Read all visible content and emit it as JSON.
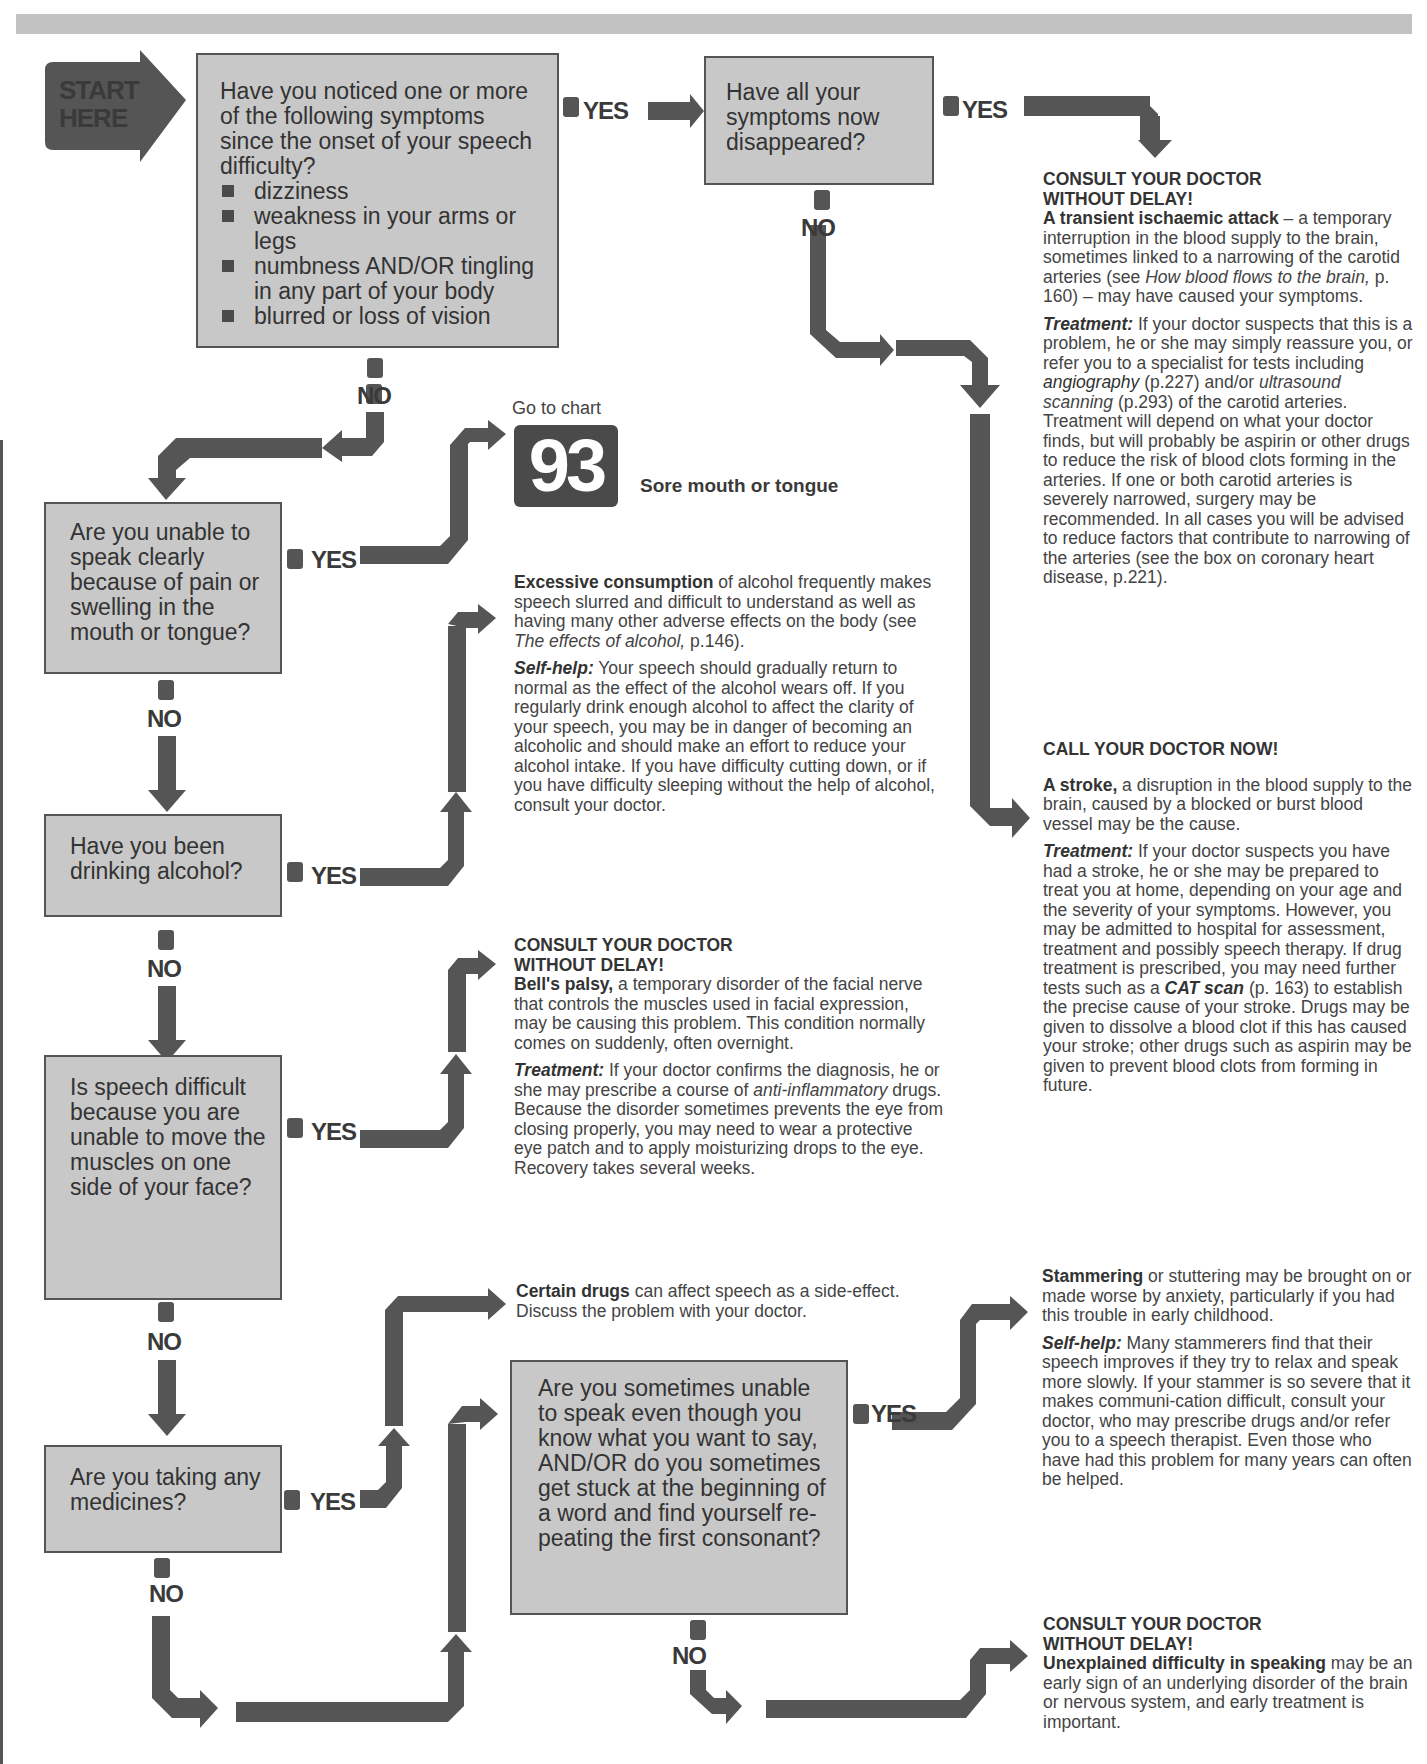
{
  "page": {
    "accent_color": "#555555",
    "box_fill": "#c8c8c8",
    "band_color": "#c2c2c2"
  },
  "start": {
    "line1": "START",
    "line2": "HERE"
  },
  "labels": {
    "yes": "YES",
    "no": "NO"
  },
  "questions": [
    {
      "id": "q1",
      "text": "Have you noticed one or more of the following symptoms since the onset of your speech difficulty?",
      "bullets": [
        "dizziness",
        "weakness in your arms or legs",
        "numbness AND/OR tingling in any part of your body",
        "blurred or loss of vision"
      ]
    },
    {
      "id": "q2",
      "text": "Have all your symptoms now disappeared?"
    },
    {
      "id": "q3",
      "text": "Are you unable to speak clearly because of pain or swelling in the mouth or tongue?"
    },
    {
      "id": "q4",
      "text": "Have you been drinking alcohol?"
    },
    {
      "id": "q5",
      "text": "Is speech difficult because you are unable to move the muscles on one side of your face?"
    },
    {
      "id": "q6",
      "text": "Are you taking any medicines?"
    },
    {
      "id": "q7",
      "text": "Are you sometimes unable to speak even though you know what you want to say, AND/OR do you sometimes get stuck at the beginning of a word and find yourself re-peating the first consonant?"
    }
  ],
  "goto_chart": {
    "label": "Go to chart",
    "number": "93",
    "title": "Sore mouth or tongue"
  },
  "outcomes": {
    "tia": {
      "heading1": "CONSULT YOUR DOCTOR",
      "heading2": "WITHOUT DELAY!",
      "term": "A transient ischaemic attack",
      "text1": " – a temporary interruption in the blood supply to the brain, sometimes linked to a narrowing of the carotid arteries (see ",
      "ref": "How blood flows to the brain,",
      "text2": " p. 160) – may have caused your symptoms.",
      "treatment_label": "Treatment:",
      "t1": " If your doctor suspects that this is a problem, he or she may simply reassure you, or refer you to a specialist for tests including ",
      "t_angio": "angiography",
      "t2": " (p.227) and/or ",
      "t_ultra": "ultrasound scanning",
      "t3": " (p.293) of the carotid arteries. Treatment will depend on what your doctor finds, but will probably be aspirin or other drugs to reduce the risk of blood clots forming in the arteries. If one or both carotid arteries is severely narrowed, surgery may be recommended. In all cases you will be advised to reduce factors that contribute to narrowing of the arteries (see the box on coronary heart disease, p.221)."
    },
    "stroke": {
      "heading": "CALL YOUR DOCTOR NOW!",
      "term": "A stroke,",
      "text": " a disruption in the blood supply to the brain, caused by a blocked or burst blood vessel may be the cause.",
      "treatment_label": "Treatment:",
      "t1": "  If your doctor suspects you have had a stroke, he or she may be prepared to treat you at home, depending on your age and the severity of your symptoms.  However, you may be admitted to hospital for assessment, treatment and possibly speech therapy. If drug treatment is prescribed,  you may need further tests such as a ",
      "t_cat": "CAT scan",
      "t2": " (p. 163) to establish the precise cause of your stroke.  Drugs may be given to dissolve a blood clot if this has caused your stroke; other drugs such as aspirin may be given to prevent blood clots from forming in future."
    },
    "alcohol": {
      "term": "Excessive consumption",
      "text1": " of alcohol frequently makes speech slurred and difficult to understand as well as having many other adverse effects on the body (see ",
      "ref": "The effects of alcohol,",
      "text2": " p.146).",
      "selfhelp_label": "Self-help:",
      "s1": " Your speech should gradually return to normal as the effect of the alcohol wears off. If you regularly drink enough alcohol to affect the clarity of your speech, you may be in danger of becoming an alcoholic and should make an effort to reduce your alcohol intake. If you have difficulty cutting down, or if you have difficulty sleeping without the help of alcohol, consult your doctor."
    },
    "bells": {
      "heading1": "CONSULT YOUR DOCTOR",
      "heading2": "WITHOUT DELAY!",
      "term": "Bell's palsy,",
      "text": " a temporary disorder of the facial nerve that controls the muscles used in facial expression, may be causing this problem. This condition normally comes on suddenly, often overnight.",
      "treatment_label": "Treatment:",
      "t1": " If your doctor confirms the diagnosis, he or she may prescribe a course of ",
      "t_anti": "anti-inflammatory",
      "t2": " drugs. Because the disorder sometimes prevents the eye from closing properly, you may need to wear a protective eye patch and to apply moisturizing drops to the eye. Recovery takes several weeks."
    },
    "drugs": {
      "term": "Certain drugs",
      "text": " can affect speech as a side-effect. Discuss the problem with your doctor."
    },
    "stammer": {
      "term": "Stammering",
      "text": " or stuttering may be brought on or made worse by anxiety, particularly if you had this trouble in early childhood.",
      "selfhelp_label": "Self-help:",
      "s1": " Many stammerers find that their speech improves if they try to relax and speak more slowly. If your stammer is so severe that it makes communi-cation difficult, consult your doctor, who may prescribe drugs and/or refer you to a speech therapist. Even those who have had this problem for many years can often be helped."
    },
    "unexplained": {
      "heading1": "CONSULT YOUR DOCTOR",
      "heading2": "WITHOUT DELAY!",
      "term": "Unexplained difficulty in speaking",
      "text": " may be an early sign of an underlying disorder of the brain or nervous system, and early treatment is important."
    }
  }
}
